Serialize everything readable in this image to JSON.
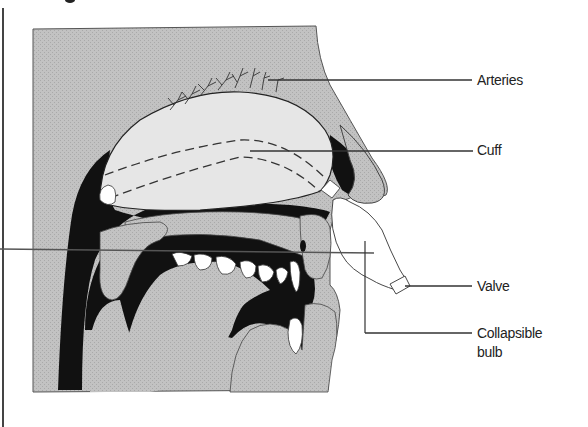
{
  "figure": {
    "labels": {
      "arteries": "Arteries",
      "cuff": "Cuff",
      "valve": "Valve",
      "bulb_line1": "Collapsible",
      "bulb_line2": "bulb"
    }
  },
  "colors": {
    "tissue": "#bdbdbd",
    "cavity": "#111111",
    "cuff": "#e6e6e6",
    "device": "#ffffff",
    "outline": "#333333",
    "leader": "#333333"
  }
}
